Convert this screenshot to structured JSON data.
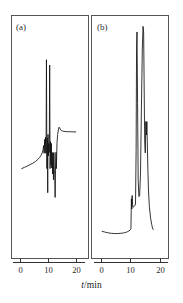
{
  "figure": {
    "axis_title_italic": "t",
    "axis_title_rest": "/min",
    "axis_title_full": "t/min",
    "background_color": "#ffffff",
    "trace_color": "#111111",
    "frame_color": "#555555"
  },
  "panels": [
    {
      "label": "(a)",
      "label_x": 16,
      "label_y": 29,
      "frame": {
        "x": 11,
        "y": 15,
        "width": 77,
        "height": 243
      },
      "axis": {
        "x0": 13,
        "x1": 85,
        "y": 262
      },
      "ticks": [
        {
          "value": "0",
          "x": 20
        },
        {
          "value": "10",
          "x": 48
        },
        {
          "value": "20",
          "x": 76
        }
      ],
      "tick_label_y": 273
    },
    {
      "label": "(b)",
      "label_x": 97,
      "label_y": 29,
      "frame": {
        "x": 92,
        "y": 15,
        "width": 77,
        "height": 243
      },
      "axis": {
        "x0": 94,
        "x1": 168,
        "y": 262
      },
      "ticks": [
        {
          "value": "0",
          "x": 101
        },
        {
          "value": "10",
          "x": 130
        },
        {
          "value": "20",
          "x": 160
        }
      ],
      "tick_label_y": 273
    }
  ],
  "chart_data": {
    "type": "line",
    "title": "",
    "xlabel": "t/min",
    "ylabel": "",
    "xlim": [
      0,
      22
    ],
    "ylim": [
      0,
      1
    ],
    "grid": false,
    "legend": null,
    "panels": [
      {
        "name": "(a)",
        "description": "Derivative-mode detector trace: flat rising baseline followed by a cluster of sharp bipolar oscillations between about 8 and 14 min, then a positive lobe near 14-15 min settling back to baseline by 20 min.",
        "series": [
          {
            "name": "detector-signal-a",
            "x": [
              0.6,
              1.6,
              2.6,
              3.6,
              4.6,
              5.6,
              6.4,
              7.0,
              7.5,
              7.9,
              8.2,
              8.45,
              8.6,
              8.8,
              8.95,
              9.1,
              9.3,
              9.45,
              9.6,
              9.75,
              9.9,
              10.0,
              10.15,
              10.3,
              10.45,
              10.6,
              10.75,
              10.9,
              11.05,
              11.2,
              11.35,
              11.5,
              11.65,
              11.8,
              11.95,
              12.1,
              12.25,
              12.4,
              12.55,
              12.7,
              12.85,
              13.0,
              13.2,
              13.45,
              13.7,
              13.95,
              14.2,
              14.5,
              14.9,
              15.4,
              16.1,
              17.0,
              18.0,
              19.0,
              19.9
            ],
            "y": [
              0.33,
              0.337,
              0.344,
              0.352,
              0.36,
              0.37,
              0.381,
              0.392,
              0.403,
              0.416,
              0.432,
              0.458,
              0.415,
              0.492,
              0.418,
              0.505,
              0.414,
              0.935,
              0.33,
              0.5,
              0.196,
              0.52,
              0.4,
              0.47,
              0.42,
              0.905,
              0.33,
              0.48,
              0.35,
              0.47,
              0.333,
              0.42,
              0.3,
              0.415,
              0.268,
              0.42,
              0.32,
              0.3,
              0.17,
              0.35,
              0.42,
              0.33,
              0.47,
              0.52,
              0.545,
              0.56,
              0.555,
              0.545,
              0.54,
              0.538,
              0.536,
              0.535,
              0.535,
              0.534,
              0.534
            ]
          }
        ]
      },
      {
        "name": "(b)",
        "description": "Integral-mode chromatogram: low flat baseline to about 10 min, a small step peak near 10.5 min, then two very tall sharp peaks near 12 and 14.5 min plus a medium peak near 15.5 min, returning abruptly to baseline at about 17.5 min.",
        "series": [
          {
            "name": "detector-signal-b",
            "x": [
              0.4,
              1.5,
              2.5,
              3.5,
              4.5,
              5.5,
              6.5,
              7.3,
              8.0,
              8.6,
              9.1,
              9.5,
              9.9,
              10.15,
              10.3,
              10.45,
              10.55,
              10.7,
              10.85,
              11.0,
              11.2,
              11.45,
              11.7,
              11.9,
              12.05,
              12.2,
              12.4,
              12.6,
              12.85,
              13.1,
              13.4,
              13.7,
              14.0,
              14.25,
              14.45,
              14.6,
              14.8,
              15.0,
              15.2,
              15.4,
              15.55,
              15.7,
              15.9,
              16.1,
              16.4,
              16.8,
              17.2,
              17.45,
              17.6,
              17.7
            ],
            "y": [
              0.07,
              0.066,
              0.063,
              0.061,
              0.06,
              0.06,
              0.061,
              0.062,
              0.064,
              0.066,
              0.069,
              0.072,
              0.076,
              0.082,
              0.215,
              0.17,
              0.23,
              0.19,
              0.18,
              0.178,
              0.18,
              0.185,
              0.192,
              0.43,
              0.88,
              0.96,
              0.64,
              0.3,
              0.225,
              0.23,
              0.33,
              0.62,
              0.88,
              0.985,
              0.96,
              0.76,
              0.48,
              0.42,
              0.56,
              0.5,
              0.56,
              0.47,
              0.34,
              0.25,
              0.18,
              0.13,
              0.1,
              0.085,
              0.08,
              0.078
            ]
          }
        ]
      }
    ]
  }
}
